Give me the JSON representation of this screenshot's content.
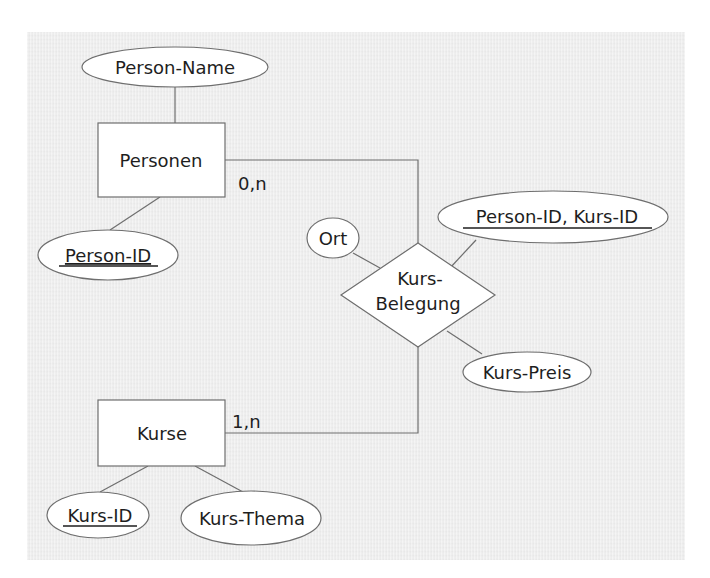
{
  "diagram": {
    "type": "er-diagram",
    "entities": [
      {
        "id": "personen",
        "label": "Personen"
      },
      {
        "id": "kurse",
        "label": "Kurse"
      }
    ],
    "relationship": {
      "id": "kurs-belegung",
      "label_line1": "Kurs-",
      "label_line2": "Belegung"
    },
    "attributes": {
      "person_name": {
        "label": "Person-Name",
        "key": false,
        "of": "Personen"
      },
      "person_id": {
        "label": "Person-ID",
        "key": true,
        "of": "Personen"
      },
      "ort": {
        "label": "Ort",
        "key": false,
        "of": "Kurs-Belegung"
      },
      "composite_key": {
        "label": "Person-ID, Kurs-ID",
        "key": true,
        "of": "Kurs-Belegung"
      },
      "kurs_preis": {
        "label": "Kurs-Preis",
        "key": false,
        "of": "Kurs-Belegung"
      },
      "kurs_id": {
        "label": "Kurs-ID",
        "key": true,
        "of": "Kurse"
      },
      "kurs_thema": {
        "label": "Kurs-Thema",
        "key": false,
        "of": "Kurse"
      }
    },
    "cardinalities": {
      "personen": "0,n",
      "kurse": "1,n"
    },
    "colors": {
      "background": "#ececec",
      "shape_fill": "#ffffff",
      "stroke": "#6e6e6e",
      "text": "#1e1e1e"
    }
  }
}
